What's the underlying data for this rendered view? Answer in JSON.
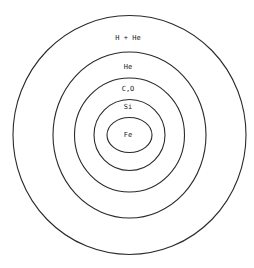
{
  "diagram": {
    "type": "concentric-shells",
    "line_color": "#2a2a2a",
    "background": "#ffffff",
    "center": {
      "x": 129.5,
      "y": 135
    },
    "shells": [
      {
        "id": "h-he",
        "label": "H + He",
        "rx": 116.5,
        "ry": 119.5,
        "label_y": 38
      },
      {
        "id": "he",
        "label": "He",
        "rx": 76.5,
        "ry": 83,
        "label_y": 67
      },
      {
        "id": "c-o",
        "label": "C,O",
        "rx": 55,
        "ry": 57,
        "label_y": 89
      },
      {
        "id": "si",
        "label": "Si",
        "rx": 35.5,
        "ry": 35.5,
        "label_y": 107
      },
      {
        "id": "fe",
        "label": "Fe",
        "rx": 22.5,
        "ry": 17.5,
        "label_y": 135
      }
    ]
  }
}
